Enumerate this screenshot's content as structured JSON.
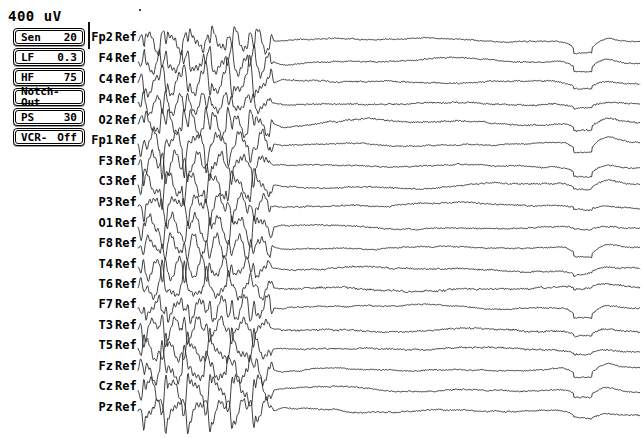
{
  "display": {
    "width": 642,
    "height": 438,
    "background": "#ffffff",
    "trace_color": "#2b2b2b",
    "text_color": "#000000",
    "scale_marker": "400 uV",
    "calibration_bar": {
      "x": 88,
      "y": 22,
      "height": 27
    }
  },
  "settings": [
    {
      "name": "sensitivity",
      "key": "Sen",
      "value": "20",
      "layout": "key-value"
    },
    {
      "name": "low-filter",
      "key": "LF",
      "value": "0.3",
      "layout": "key-value"
    },
    {
      "name": "high-filter",
      "key": "HF",
      "value": "75",
      "layout": "key-value"
    },
    {
      "name": "notch-filter",
      "key": "",
      "value": "Notch-Out",
      "layout": "solo"
    },
    {
      "name": "paper-speed",
      "key": "PS",
      "value": "30",
      "layout": "key-value"
    },
    {
      "name": "vcr",
      "key": "VCR-",
      "value": "Off",
      "layout": "key-value"
    }
  ],
  "channels": [
    {
      "site": "Fp2",
      "ref": "Ref",
      "baseline": 41
    },
    {
      "site": "F4",
      "ref": "Ref",
      "baseline": 62
    },
    {
      "site": "C4",
      "ref": "Ref",
      "baseline": 83
    },
    {
      "site": "P4",
      "ref": "Ref",
      "baseline": 103
    },
    {
      "site": "O2",
      "ref": "Ref",
      "baseline": 124
    },
    {
      "site": "Fp1",
      "ref": "Ref",
      "baseline": 144
    },
    {
      "site": "F3",
      "ref": "Ref",
      "baseline": 165
    },
    {
      "site": "C3",
      "ref": "Ref",
      "baseline": 185
    },
    {
      "site": "P3",
      "ref": "Ref",
      "baseline": 206
    },
    {
      "site": "O1",
      "ref": "Ref",
      "baseline": 227
    },
    {
      "site": "F8",
      "ref": "Ref",
      "baseline": 247
    },
    {
      "site": "T4",
      "ref": "Ref",
      "baseline": 268
    },
    {
      "site": "T6",
      "ref": "Ref",
      "baseline": 288
    },
    {
      "site": "F7",
      "ref": "Ref",
      "baseline": 308
    },
    {
      "site": "T3",
      "ref": "Ref",
      "baseline": 329
    },
    {
      "site": "T5",
      "ref": "Ref",
      "baseline": 349
    },
    {
      "site": "Fz",
      "ref": "Ref",
      "baseline": 370
    },
    {
      "site": "Cz",
      "ref": "Ref",
      "baseline": 390
    },
    {
      "site": "Pz",
      "ref": "Ref",
      "baseline": 411
    }
  ],
  "chart_data": {
    "type": "line",
    "title": "",
    "xlabel": "",
    "ylabel": "",
    "trace_start_x": 138,
    "trace_end_x": 640,
    "burst": {
      "name": "generalized-spike-wave-burst",
      "x_start": 138,
      "x_end": 274,
      "amplitude": 17,
      "spike_rate_hz": 3.1
    },
    "background_activity": {
      "name": "low-amplitude-background",
      "x_start": 274,
      "x_end": 640,
      "amplitude": 2.0,
      "noise": 1.1
    },
    "artifact": {
      "name": "blink-artifact-downward-deflection",
      "x_center": 583,
      "width": 34,
      "depth": 9
    },
    "series": [
      {
        "name": "Fp2-Ref",
        "burst_gain": 1.0,
        "bg_gain": 0.55,
        "artifact_gain": 1.3,
        "slow_gain": 0.9,
        "seed": 11
      },
      {
        "name": "F4-Ref",
        "burst_gain": 1.05,
        "bg_gain": 0.6,
        "artifact_gain": 1.15,
        "slow_gain": 1.0,
        "seed": 23
      },
      {
        "name": "C4-Ref",
        "burst_gain": 0.95,
        "bg_gain": 0.7,
        "artifact_gain": 0.7,
        "slow_gain": 1.1,
        "seed": 37
      },
      {
        "name": "P4-Ref",
        "burst_gain": 0.9,
        "bg_gain": 0.75,
        "artifact_gain": 0.5,
        "slow_gain": 0.8,
        "seed": 49
      },
      {
        "name": "O2-Ref",
        "burst_gain": 1.0,
        "bg_gain": 0.8,
        "artifact_gain": 1.0,
        "slow_gain": 1.3,
        "seed": 61
      },
      {
        "name": "Fp1-Ref",
        "burst_gain": 1.1,
        "bg_gain": 0.55,
        "artifact_gain": 1.35,
        "slow_gain": 0.9,
        "seed": 73
      },
      {
        "name": "F3-Ref",
        "burst_gain": 1.05,
        "bg_gain": 0.6,
        "artifact_gain": 1.1,
        "slow_gain": 1.0,
        "seed": 87
      },
      {
        "name": "C3-Ref",
        "burst_gain": 0.95,
        "bg_gain": 0.7,
        "artifact_gain": 0.65,
        "slow_gain": 1.1,
        "seed": 99
      },
      {
        "name": "P3-Ref",
        "burst_gain": 0.92,
        "bg_gain": 0.75,
        "artifact_gain": 0.45,
        "slow_gain": 0.9,
        "seed": 113
      },
      {
        "name": "O1-Ref",
        "burst_gain": 0.98,
        "bg_gain": 0.65,
        "artifact_gain": 0.35,
        "slow_gain": 0.7,
        "seed": 127
      },
      {
        "name": "F8-Ref",
        "burst_gain": 1.0,
        "bg_gain": 0.55,
        "artifact_gain": 1.05,
        "slow_gain": 0.8,
        "seed": 139
      },
      {
        "name": "T4-Ref",
        "burst_gain": 0.9,
        "bg_gain": 0.8,
        "artifact_gain": 0.55,
        "slow_gain": 1.0,
        "seed": 151
      },
      {
        "name": "T6-Ref",
        "burst_gain": 0.88,
        "bg_gain": 0.95,
        "artifact_gain": 0.4,
        "slow_gain": 0.9,
        "seed": 163
      },
      {
        "name": "F7-Ref",
        "burst_gain": 1.02,
        "bg_gain": 0.6,
        "artifact_gain": 1.15,
        "slow_gain": 0.9,
        "seed": 177
      },
      {
        "name": "T3-Ref",
        "burst_gain": 0.93,
        "bg_gain": 0.85,
        "artifact_gain": 0.6,
        "slow_gain": 1.1,
        "seed": 189
      },
      {
        "name": "T5-Ref",
        "burst_gain": 0.9,
        "bg_gain": 0.8,
        "artifact_gain": 0.45,
        "slow_gain": 0.9,
        "seed": 201
      },
      {
        "name": "Fz-Ref",
        "burst_gain": 1.08,
        "bg_gain": 0.6,
        "artifact_gain": 1.2,
        "slow_gain": 1.0,
        "seed": 213
      },
      {
        "name": "Cz-Ref",
        "burst_gain": 1.05,
        "bg_gain": 0.65,
        "artifact_gain": 0.95,
        "slow_gain": 1.1,
        "seed": 227
      },
      {
        "name": "Pz-Ref",
        "burst_gain": 1.0,
        "bg_gain": 0.7,
        "artifact_gain": 0.55,
        "slow_gain": 1.2,
        "seed": 239
      }
    ]
  }
}
